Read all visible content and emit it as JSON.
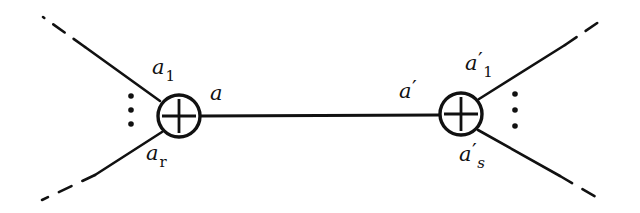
{
  "figure": {
    "kind": "vertex-diagram",
    "background_color": "#ffffff",
    "ink_color": "#111111",
    "width": 640,
    "height": 213
  },
  "labels": {
    "left_top_leg": {
      "base": "a",
      "sub": "1",
      "prime": ""
    },
    "left_bottom_leg": {
      "base": "a",
      "sub": "r",
      "prime": ""
    },
    "internal_left": {
      "base": "a",
      "sub": "",
      "prime": ""
    },
    "internal_right": {
      "base": "a",
      "sub": "",
      "prime": "′"
    },
    "right_top_leg": {
      "base": "a",
      "sub": "1",
      "prime": "′"
    },
    "right_bottom_leg": {
      "base": "a",
      "sub": "s",
      "prime": "′"
    }
  },
  "vertices": [
    {
      "name": "left-vertex",
      "symbol": "+",
      "cx": 179,
      "cy": 116,
      "r": 21
    },
    {
      "name": "right-vertex",
      "symbol": "+",
      "cx": 461,
      "cy": 114,
      "r": 21
    }
  ],
  "internal_line": {
    "x1": 200,
    "y1": 116,
    "x2": 440,
    "y2": 115
  },
  "legs": [
    {
      "name": "left-upper-leg",
      "solid": [
        160,
        101,
        85,
        47
      ],
      "dashed": [
        85,
        47,
        43,
        17
      ]
    },
    {
      "name": "left-lower-leg",
      "solid": [
        162,
        132,
        95,
        175
      ],
      "dashed": [
        95,
        175,
        42,
        200
      ]
    },
    {
      "name": "right-upper-leg",
      "solid": [
        479,
        99,
        565,
        45
      ],
      "dashed": [
        565,
        45,
        606,
        17
      ]
    },
    {
      "name": "right-lower-leg",
      "solid": [
        478,
        130,
        560,
        176
      ],
      "dashed": [
        560,
        176,
        601,
        200
      ]
    }
  ],
  "ellipses": [
    {
      "name": "left-ellipsis",
      "x": 131,
      "ys": [
        96,
        110,
        124
      ],
      "radius": 2.6
    },
    {
      "name": "right-ellipsis",
      "x": 515,
      "ys": [
        94,
        110,
        126
      ],
      "radius": 2.6
    }
  ]
}
